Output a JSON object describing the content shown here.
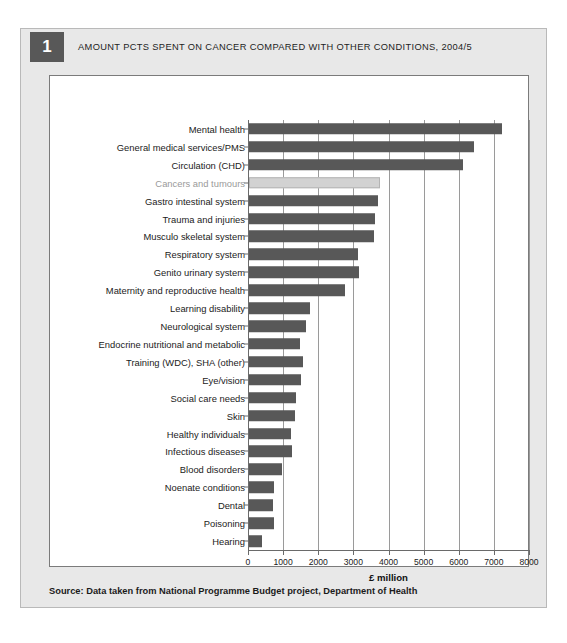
{
  "figure": {
    "number": "1",
    "title": "AMOUNT PCTS SPENT ON CANCER COMPARED WITH OTHER CONDITIONS, 2004/5",
    "source": "Source: Data taken from National Programme Budget project, Department of Health"
  },
  "colors": {
    "bar": "#585858",
    "bar_highlight": "#d2d2d2",
    "highlight_label_text": "#9a9a9a",
    "grid": "#9a9a9a",
    "card_background": "#e8e8e8",
    "plot_background": "#ffffff"
  },
  "chart_data": {
    "type": "bar",
    "orientation": "horizontal",
    "title": "AMOUNT PCTS SPENT ON CANCER COMPARED WITH OTHER CONDITIONS, 2004/5",
    "xlabel": "£ million",
    "ylabel": "",
    "xlim": [
      0,
      8000
    ],
    "xticks": [
      0,
      1000,
      2000,
      3000,
      4000,
      5000,
      6000,
      7000,
      8000
    ],
    "xtick_labels": [
      "0",
      "1000",
      "2000",
      "3000",
      "4000",
      "5000",
      "6000",
      "7000",
      "8000"
    ],
    "grid": true,
    "grid_axis": "x",
    "legend": false,
    "highlight_category": "Cancers and tumours",
    "categories": [
      "Mental health",
      "General medical services/PMS",
      "Circulation (CHD)",
      "Cancers and tumours",
      "Gastro intestinal system",
      "Trauma and injuries",
      "Musculo skeletal system",
      "Respiratory system",
      "Genito urinary system",
      "Maternity and reproductive health",
      "Learning disability",
      "Neurological system",
      "Endocrine nutritional and metabolic",
      "Training (WDC), SHA (other)",
      "Eye/vision",
      "Social care needs",
      "Skin",
      "Healthy individuals",
      "Infectious diseases",
      "Blood disorders",
      "Noenate conditions",
      "Dental",
      "Poisoning",
      "Hearing"
    ],
    "values": [
      7200,
      6400,
      6100,
      3740,
      3670,
      3600,
      3550,
      3090,
      3130,
      2740,
      1750,
      1630,
      1460,
      1540,
      1470,
      1350,
      1320,
      1190,
      1230,
      930,
      700,
      690,
      700,
      370
    ]
  }
}
